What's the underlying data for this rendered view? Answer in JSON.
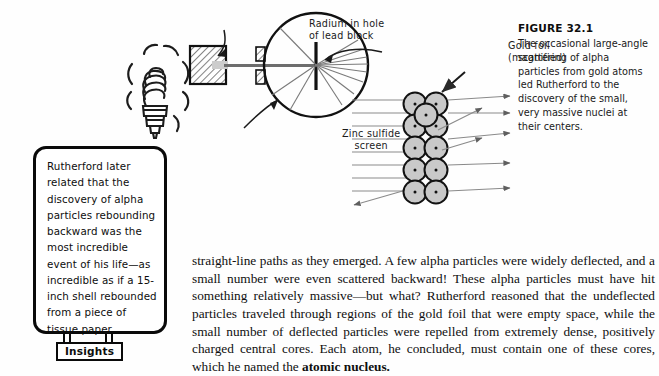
{
  "figure": {
    "title": "FIGURE 32.1",
    "caption": "The occasional large-angle scattering of alpha particles from gold atoms led Rutherford to the discovery of the small, very massive nuclei at their centers."
  },
  "diagram": {
    "labels": {
      "radium": "Radium in hole\nof lead block",
      "zinc": "Zinc sulfide\nscreen",
      "gold": "Gold foil\n(magnified)"
    },
    "icons": {
      "lead_block": "lead-block-icon",
      "collimator_slit": "collimator-slit-icon",
      "detector_circle": "zinc-sulfide-screen-circle",
      "gold_foil_bar": "gold-foil-bar",
      "atom": "gold-atom-circle",
      "light_bulb": "light-bulb-icon"
    },
    "atom_count": 11,
    "colors": {
      "ink": "#141414",
      "atom_fill": "#c9c9c9",
      "ray": "#6a6a6a"
    }
  },
  "insights": {
    "tab_label": "Insights",
    "quote": "Rutherford later related that the discovery of alpha particles rebounding backward was the most incredible event of his life—as incredible as if a 15-inch shell rebounded from a piece of tissue paper."
  },
  "body": {
    "paragraph_lead": "straight-line paths as they emerged. A few alpha particles were widely deflected, and a small number were even scattered backward! These alpha particles must have hit something relatively massive—but what? Rutherford reasoned that the undeflected particles traveled through regions of the gold foil that were empty space, while the small number of deflected particles were repelled from extremely dense, positively charged central cores. Each atom, he concluded, must contain one of these cores, which he named the ",
    "term_bold": "atomic nucleus.",
    "paragraph_tail": ""
  }
}
